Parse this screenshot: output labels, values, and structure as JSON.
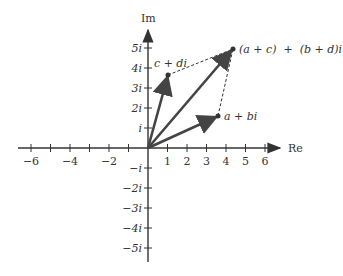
{
  "diagram": {
    "axes": {
      "x_label": "Re",
      "y_label": "Im",
      "x_ticks": [
        "−6",
        "−4",
        "−2",
        "1",
        "2",
        "3",
        "4",
        "5",
        "6"
      ],
      "y_ticks_pos": [
        "i",
        "2i",
        "3i",
        "4i",
        "5i"
      ],
      "y_ticks_neg": [
        "−i",
        "−2i",
        "−3i",
        "−4i",
        "−5i"
      ]
    },
    "points": {
      "z1": {
        "label": "a + bi",
        "re": 3.6,
        "im": 1.6
      },
      "z2": {
        "label": "c + di",
        "re": 1.0,
        "im": 3.7
      },
      "sum": {
        "label": "(a + c)  +  (b + d)i",
        "re": 4.4,
        "im": 5.0
      }
    },
    "colors": {
      "vector": "#444444",
      "axis": "#333333",
      "dashed": "#333333"
    }
  }
}
